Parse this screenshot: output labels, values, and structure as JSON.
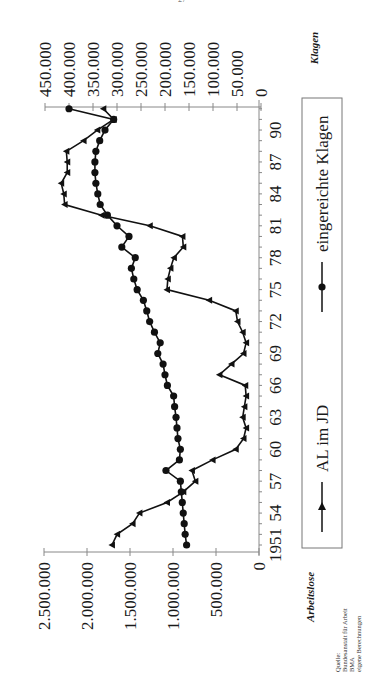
{
  "page_mark": "27",
  "chart_data": {
    "type": "line",
    "title": "",
    "xlabel": "",
    "x_tick_labels": [
      "1951",
      "54",
      "57",
      "60",
      "63",
      "66",
      "69",
      "72",
      "75",
      "78",
      "81",
      "84",
      "87",
      "90"
    ],
    "x_tick_years": [
      1951,
      1954,
      1957,
      1960,
      1963,
      1966,
      1969,
      1972,
      1975,
      1978,
      1981,
      1984,
      1987,
      1990
    ],
    "x": [
      1951,
      1952,
      1953,
      1954,
      1955,
      1956,
      1957,
      1958,
      1959,
      1960,
      1961,
      1962,
      1963,
      1964,
      1965,
      1966,
      1967,
      1968,
      1969,
      1970,
      1971,
      1972,
      1973,
      1974,
      1975,
      1976,
      1977,
      1978,
      1979,
      1980,
      1981,
      1982,
      1983,
      1984,
      1985,
      1986,
      1987,
      1988,
      1989,
      1990,
      1991,
      1992
    ],
    "left_axis": {
      "label": "Arbeitslose",
      "ylim": [
        0,
        2500000
      ],
      "tick_values": [
        0,
        500000,
        1000000,
        1500000,
        2000000,
        2500000
      ],
      "tick_labels": [
        "0",
        "500.000",
        "1.000.000",
        "1.500.000",
        "2.000.000",
        "2.500.000"
      ]
    },
    "right_axis": {
      "label": "Klagen",
      "ylim": [
        0,
        450000
      ],
      "tick_values": [
        0,
        50000,
        100000,
        150000,
        200000,
        250000,
        300000,
        350000,
        400000,
        450000
      ],
      "tick_labels": [
        "0",
        "50.000",
        "100.000",
        "150.000",
        "200.000",
        "250.000",
        "300.000",
        "350.000",
        "400.000",
        "450.000"
      ]
    },
    "series": [
      {
        "name": "AL im JD",
        "axis": "left",
        "marker": "triangle",
        "values": [
          1710000,
          1650000,
          1470000,
          1390000,
          1070000,
          880000,
          740000,
          780000,
          540000,
          270000,
          180000,
          150000,
          190000,
          170000,
          150000,
          160000,
          460000,
          320000,
          180000,
          150000,
          190000,
          250000,
          270000,
          580000,
          1070000,
          1060000,
          1030000,
          990000,
          880000,
          890000,
          1270000,
          1830000,
          2260000,
          2270000,
          2300000,
          2230000,
          2230000,
          2240000,
          2040000,
          1880000,
          1690000,
          1810000
        ],
        "color": "#111111"
      },
      {
        "name": "eingereichte Klagen",
        "axis": "right",
        "marker": "circle",
        "values": [
          155000,
          158000,
          160000,
          162000,
          164000,
          166000,
          168000,
          198000,
          170000,
          168000,
          173000,
          175000,
          177000,
          180000,
          182000,
          195000,
          200000,
          204000,
          215000,
          210000,
          222000,
          232000,
          238000,
          245000,
          258000,
          265000,
          270000,
          262000,
          290000,
          275000,
          300000,
          320000,
          335000,
          340000,
          344000,
          346000,
          346000,
          344000,
          336000,
          325000,
          307000,
          400000
        ],
        "color": "#111111"
      }
    ],
    "legend": {
      "position": "bottom",
      "entries": [
        {
          "label": "AL im JD",
          "marker": "triangle"
        },
        {
          "label": "eingereichte Klagen",
          "marker": "circle"
        }
      ]
    },
    "grid": false,
    "rotation_deg": -90,
    "source_note": [
      "Quelle:",
      "Bundesanstalt für Arbeit",
      "BMA",
      "eigene Berechnungen"
    ]
  }
}
